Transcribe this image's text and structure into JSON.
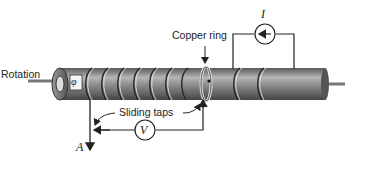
{
  "diagram": {
    "type": "physics-apparatus",
    "labels": {
      "rotation": "Rotation",
      "copper_ring": "Copper ring",
      "sliding_taps": "Sliding taps",
      "current_symbol": "I",
      "voltmeter_symbol": "V",
      "axis_symbol": "A",
      "angle_symbol": "φ"
    },
    "components": [
      {
        "id": "cylinder",
        "name": "Rotating cylinder with helical winding"
      },
      {
        "id": "ammeter",
        "name": "Current source / ammeter",
        "symbol": "I"
      },
      {
        "id": "voltmeter",
        "name": "Voltmeter",
        "symbol": "V"
      },
      {
        "id": "copper-ring",
        "name": "Copper ring"
      },
      {
        "id": "sliding-taps",
        "name": "Sliding taps"
      },
      {
        "id": "axis-arrow",
        "name": "Axis A"
      }
    ],
    "colors": {
      "cylinder_body": "#8a8a8a",
      "line": "#222222"
    }
  }
}
